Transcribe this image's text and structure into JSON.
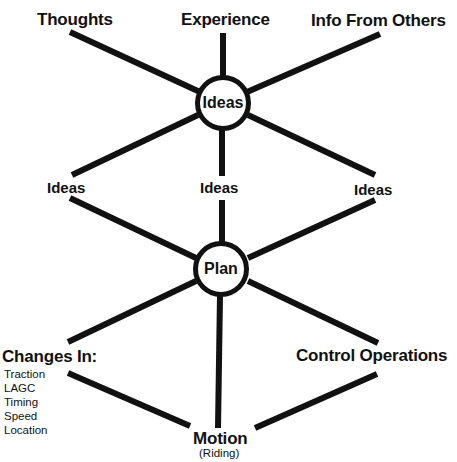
{
  "diagram": {
    "colors": {
      "stroke": "#111111",
      "background": "#ffffff"
    },
    "top_sources": {
      "thoughts": "Thoughts",
      "experience": "Experience",
      "info_from_others": "Info From Others"
    },
    "hub_ideas": "Ideas",
    "middle_outputs": {
      "left": "Ideas",
      "center": "Ideas",
      "right": "Ideas"
    },
    "hub_plan": "Plan",
    "bottom": {
      "changes_in": {
        "title": "Changes In:",
        "items": [
          "Traction",
          "LAGC",
          "Timing",
          "Speed",
          "Location"
        ]
      },
      "control_operations": "Control Operations",
      "motion": "Motion",
      "motion_sub": "(Riding)"
    }
  }
}
